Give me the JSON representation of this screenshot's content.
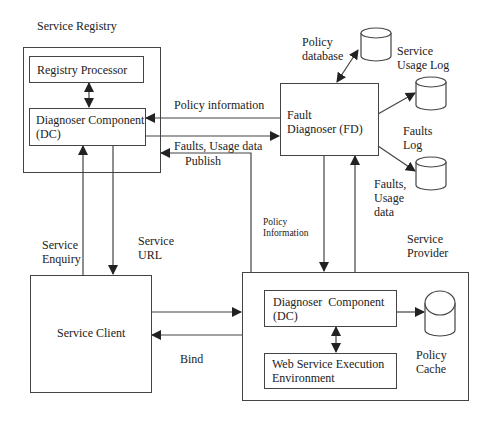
{
  "diagram": {
    "type": "architecture",
    "containers": {
      "service_registry": {
        "title": "Service Registry"
      },
      "service_provider": {
        "title": "Service Provider"
      }
    },
    "nodes": {
      "registry_processor": "Registry Processor",
      "registry_dc": [
        "Diagnoser Component",
        "(DC)"
      ],
      "fault_diagnoser": [
        "Fault",
        "Diagnoser (FD)"
      ],
      "service_client": "Service Client",
      "provider_dc": [
        "Diagnoser  Component",
        "(DC)"
      ],
      "wsee": [
        "Web Service Execution",
        "Environment"
      ]
    },
    "datastores": {
      "policy_database": [
        "Policy",
        "database"
      ],
      "service_usage_log": [
        "Service",
        "Usage Log"
      ],
      "faults_log": [
        "Faults",
        "Log"
      ],
      "policy_cache": [
        "Policy",
        "Cache"
      ]
    },
    "edges": {
      "policy_information": "Policy information",
      "faults_usage_data": "Faults, Usage data",
      "publish": "Publish",
      "service_enquiry": [
        "Service",
        "Enquiry"
      ],
      "service_url": [
        "Service",
        "URL"
      ],
      "policy_information_small": [
        "Policy",
        "Information"
      ],
      "faults_usage_data_right": [
        "Faults,",
        "Usage",
        "data"
      ],
      "bind": "Bind"
    },
    "colors": {
      "stroke": "#444444",
      "text": "#222222",
      "background": "#ffffff"
    }
  }
}
